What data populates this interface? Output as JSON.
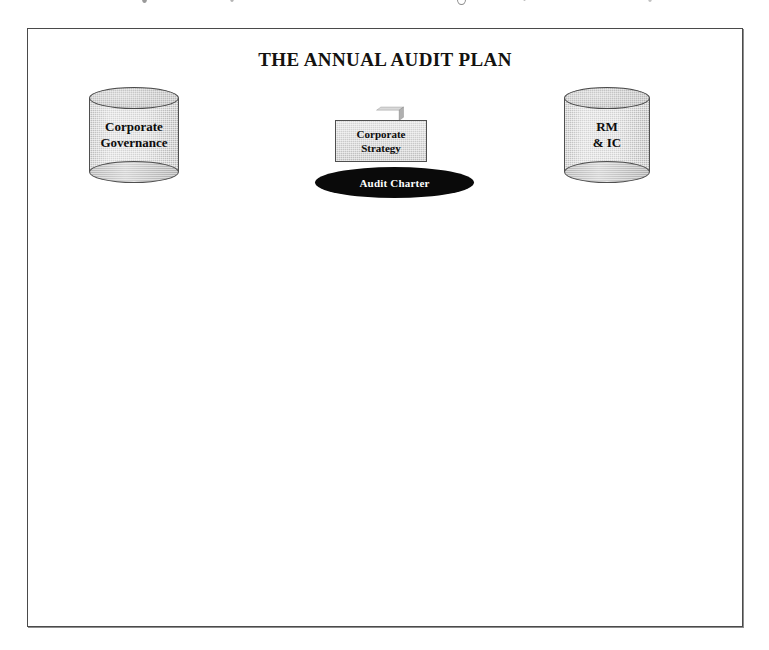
{
  "page": {
    "background_color": "#ffffff",
    "width": 769,
    "height": 650
  },
  "frame": {
    "border_color": "#4a4a4a",
    "fill_color": "#ffffff"
  },
  "diagram": {
    "title": "THE ANNUAL AUDIT PLAN",
    "nodes": [
      {
        "id": "corporate-governance",
        "shape": "cylinder",
        "label_lines": [
          "Corporate",
          "Governance"
        ],
        "fill_color": "#cacaca",
        "outline_color": "#4f4f4f",
        "text_color": "#0d0d0d"
      },
      {
        "id": "corporate-strategy",
        "shape": "box-3d",
        "label_lines": [
          "Corporate",
          "Strategy"
        ],
        "fill_color": "#cbcbcb",
        "top_face_color": "#d9d9d9",
        "side_face_color": "#b0b0b0",
        "outline_color": "#4f4f4f",
        "text_color": "#0d0d0d"
      },
      {
        "id": "audit-charter",
        "shape": "ellipse",
        "label": "Audit Charter",
        "fill_color": "#0a0a0a",
        "text_color": "#ffffff"
      },
      {
        "id": "rm-ic",
        "shape": "cylinder",
        "label_lines": [
          "RM",
          "& IC"
        ],
        "fill_color": "#cacaca",
        "outline_color": "#4f4f4f",
        "text_color": "#0d0d0d"
      }
    ]
  }
}
